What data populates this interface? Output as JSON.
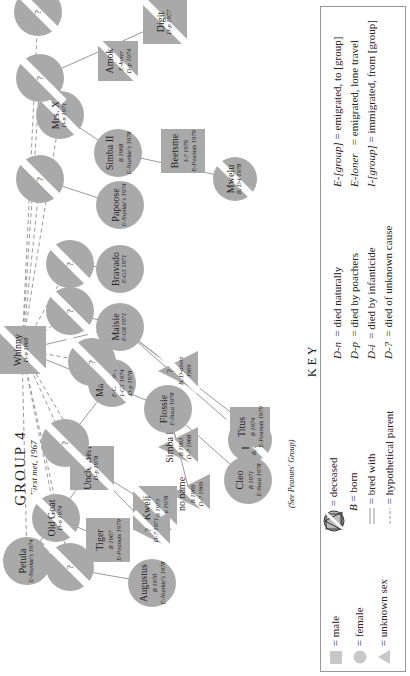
{
  "title": {
    "main": "GROUP 4",
    "sub": "First met, 1967"
  },
  "note": "(See Peanuts' Group)",
  "colors": {
    "symbol_fill": "#a9a9a9",
    "deceased_band": "#ffffff",
    "line": "#999999",
    "text": "#222222",
    "key_border": "#999999"
  },
  "nodes": [
    {
      "id": "whinny",
      "name": "Whinny",
      "sex": "male",
      "lines": [
        "D-n 1968"
      ],
      "deceased": true
    },
    {
      "id": "digit",
      "name": "Digit",
      "sex": "male",
      "lines": [
        "D-p 1977"
      ],
      "deceased": true
    },
    {
      "id": "beetsme",
      "name": "Beetsme",
      "sex": "male",
      "lines": [
        "I-? 1976",
        "E-Peanuts 1979"
      ],
      "deceased": false
    },
    {
      "id": "amok",
      "name": "Amok",
      "sex": "male",
      "lines": [
        "E-loner",
        "D-p 1974"
      ],
      "deceased": true
    },
    {
      "id": "mrs_x",
      "name": "Mrs. X",
      "sex": "female",
      "lines": [
        "D-n 1971"
      ],
      "deceased": true
    },
    {
      "id": "mwelu",
      "name": "Mwelu",
      "sex": "female",
      "lines": [
        "B, D-i 1978"
      ],
      "deceased": true
    },
    {
      "id": "simba2",
      "name": "Simba II",
      "sex": "female",
      "lines": [
        "B 1968",
        "E-Nunkie's 1978"
      ],
      "deceased": false
    },
    {
      "id": "papoose",
      "name": "Papoose",
      "sex": "female",
      "lines": [
        "E-Nunkie's 1974"
      ],
      "deceased": false
    },
    {
      "id": "bravado",
      "name": "Bravado",
      "sex": "female",
      "lines": [
        "E-G5 1971"
      ],
      "deceased": false
    },
    {
      "id": "maisie",
      "name": "Maisie",
      "sex": "female",
      "lines": [
        "E-G8 1971"
      ],
      "deceased": false
    },
    {
      "id": "fritz",
      "name": "Fritz",
      "sex": "female",
      "lines": [
        "B, D-i 1978"
      ],
      "deceased": true
    },
    {
      "id": "titus",
      "name": "Titus",
      "sex": "male",
      "lines": [
        "B 1974",
        "E-Peanuts 1979"
      ],
      "deceased": false
    },
    {
      "id": "unk_abort",
      "name": "?",
      "sex": "unknown",
      "lines": [
        "B, D-abort",
        "1969"
      ],
      "deceased": true
    },
    {
      "id": "cleo",
      "name": "Cleo",
      "sex": "female",
      "lines": [
        "B 1971",
        "E-Susa 1978"
      ],
      "deceased": false
    },
    {
      "id": "simba1",
      "name": "Simba I",
      "sex": "unknown",
      "lines": [
        "B 1963",
        "D-? 1968"
      ],
      "deceased": true
    },
    {
      "id": "flossie",
      "name": "Flossie",
      "sex": "female",
      "lines": [
        "E-Susa 1978"
      ],
      "deceased": false
    },
    {
      "id": "no_name",
      "name": "no name",
      "sex": "unknown",
      "lines": [
        "B 1969",
        "D-? 1969"
      ],
      "deceased": true
    },
    {
      "id": "macho",
      "name": "Macho",
      "sex": "female",
      "lines": [
        "E-G8 1971",
        "I-G5 1974",
        "D-p 1978"
      ],
      "deceased": true
    },
    {
      "id": "kweli",
      "name": "Kweli",
      "sex": "male",
      "lines": [
        "B 1973",
        "D-p 1978"
      ],
      "deceased": true
    },
    {
      "id": "uncle_bert",
      "name": "Uncle Bert",
      "sex": "male",
      "lines": [
        "D-p 1978"
      ],
      "deceased": true
    },
    {
      "id": "unk_1971",
      "name": "?",
      "sex": "unknown",
      "lines": [
        "D-? 1971"
      ],
      "deceased": true
    },
    {
      "id": "old_goat",
      "name": "Old Goat",
      "sex": "female",
      "lines": [
        "D-n 1974"
      ],
      "deceased": true
    },
    {
      "id": "tiger",
      "name": "Tiger",
      "sex": "male",
      "lines": [
        "B 1967",
        "E-Peanuts 1979"
      ],
      "deceased": false
    },
    {
      "id": "petula",
      "name": "Petula",
      "sex": "female",
      "lines": [
        "E-Nunkie's 1974"
      ],
      "deceased": false
    },
    {
      "id": "augustus",
      "name": "Augustus",
      "sex": "female",
      "lines": [
        "B 1970",
        "E-Nunkie's 1978"
      ],
      "deceased": false
    },
    {
      "id": "q1",
      "name": "?",
      "sex": "female",
      "lines": [],
      "deceased": true
    },
    {
      "id": "q2",
      "name": "?",
      "sex": "female",
      "lines": [],
      "deceased": true
    },
    {
      "id": "q3",
      "name": "?",
      "sex": "female",
      "lines": [],
      "deceased": true
    },
    {
      "id": "q4",
      "name": "?",
      "sex": "female",
      "lines": [],
      "deceased": true
    },
    {
      "id": "q5",
      "name": "?",
      "sex": "female",
      "lines": [],
      "deceased": true
    },
    {
      "id": "q6",
      "name": "?",
      "sex": "female",
      "lines": [],
      "deceased": true
    },
    {
      "id": "q7",
      "name": "?",
      "sex": "female",
      "lines": [],
      "deceased": true
    },
    {
      "id": "q8",
      "name": "?",
      "sex": "female",
      "lines": [],
      "deceased": true
    }
  ],
  "key": {
    "title": "KEY",
    "symbols": [
      {
        "symbol": "square",
        "meaning": "male"
      },
      {
        "symbol": "circle",
        "meaning": "female"
      },
      {
        "symbol": "triangle",
        "meaning": "unknown sex"
      }
    ],
    "markers": [
      {
        "symbol": "deceased-band",
        "meaning": "deceased"
      },
      {
        "symbol": "B",
        "meaning": "born"
      },
      {
        "symbol": "double-line",
        "meaning": "bred with"
      },
      {
        "symbol": "dashed-line",
        "meaning": "hypothetical parent"
      }
    ],
    "deaths": [
      {
        "code": "D-n",
        "meaning": "died naturally"
      },
      {
        "code": "D-p",
        "meaning": "died by poachers"
      },
      {
        "code": "D-i",
        "meaning": "died by infanticide"
      },
      {
        "code": "D-?",
        "meaning": "died of unknown cause"
      }
    ],
    "migration": [
      {
        "code": "E-[group]",
        "meaning": "emigrated, to [group]"
      },
      {
        "code": "E-loner",
        "meaning": "emigrated, lone travel"
      },
      {
        "code": "I-[group]",
        "meaning": "immigrated, from [group]"
      }
    ],
    "equals": "="
  }
}
